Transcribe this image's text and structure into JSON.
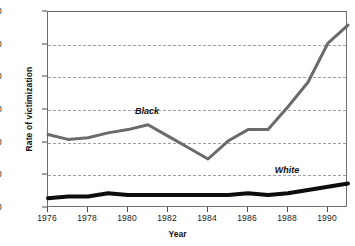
{
  "chart_data": {
    "type": "line",
    "title": "",
    "xlabel": "Year",
    "ylabel": "Rate of victimization",
    "xlim": [
      1976,
      1991
    ],
    "ylim": [
      0,
      120
    ],
    "xticks": [
      1976,
      1978,
      1980,
      1982,
      1984,
      1986,
      1988,
      1990
    ],
    "yticks": [
      0,
      20,
      40,
      60,
      80,
      100,
      120
    ],
    "grid": "horizontal-dashed",
    "legend": "inline-labels",
    "x": [
      1976,
      1977,
      1978,
      1979,
      1980,
      1981,
      1982,
      1983,
      1984,
      1985,
      1986,
      1987,
      1988,
      1989,
      1990,
      1991
    ],
    "series": [
      {
        "name": "Black",
        "color": "#6b6b6b",
        "values": [
          45,
          42,
          43,
          46,
          48,
          51,
          44,
          37,
          30,
          41,
          48,
          48,
          62,
          77,
          101,
          112
        ],
        "label_x": 1981,
        "label_y": 58
      },
      {
        "name": "White",
        "color": "#0d0d0d",
        "values": [
          6,
          7,
          7,
          9,
          8,
          8,
          8,
          8,
          8,
          8,
          9,
          8,
          9,
          11,
          13,
          15
        ],
        "label_x": 1988,
        "label_y": 22
      }
    ]
  },
  "axes": {
    "y": {
      "title": "Rate of victimization",
      "ticks": [
        "0",
        "20",
        "40",
        "60",
        "80",
        "100",
        "120"
      ]
    },
    "x": {
      "title": "Year",
      "ticks": [
        "1976",
        "1978",
        "1980",
        "1982",
        "1984",
        "1986",
        "1988",
        "1990"
      ]
    }
  },
  "series_labels": [
    {
      "text": "Black"
    },
    {
      "text": "White"
    }
  ],
  "colors": {
    "black_series": "#6b6b6b",
    "white_series": "#0d0d0d",
    "gridline": "#8e8ea5",
    "axis": "#6f6f6f",
    "text": "#111111",
    "background": "#ffffff"
  }
}
